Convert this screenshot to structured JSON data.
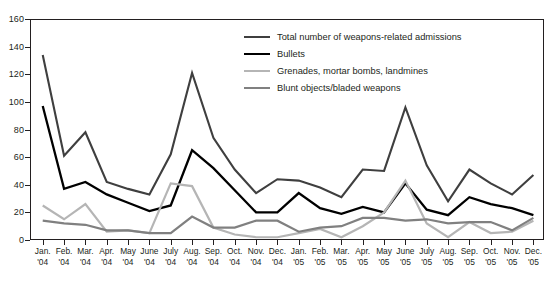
{
  "chart_data": {
    "type": "line",
    "title": "",
    "xlabel": "",
    "ylabel": "",
    "ylim": [
      0,
      160
    ],
    "yticks": [
      0,
      20,
      40,
      60,
      80,
      100,
      120,
      140,
      160
    ],
    "grid": false,
    "legend_position": "top-center",
    "categories": [
      "Jan. '04",
      "Feb. '04",
      "Mar. '04",
      "Apr. '04",
      "May '04",
      "June '04",
      "July '04",
      "Aug. '04",
      "Sep. '04",
      "Oct. '04",
      "Nov. '04",
      "Dec. '04",
      "Jan. '05",
      "Feb. '05",
      "Mar. '05",
      "Apr. '05",
      "May '05",
      "June '05",
      "July '05",
      "Aug. '05",
      "Sep. '05",
      "Oct. '05",
      "Nov. '05",
      "Dec. '05"
    ],
    "category_lines": [
      [
        "Jan.",
        "'04"
      ],
      [
        "Feb.",
        "'04"
      ],
      [
        "Mar.",
        "'04"
      ],
      [
        "Apr.",
        "'04"
      ],
      [
        "May",
        "'04"
      ],
      [
        "June",
        "'04"
      ],
      [
        "July",
        "'04"
      ],
      [
        "Aug.",
        "'04"
      ],
      [
        "Sep.",
        "'04"
      ],
      [
        "Oct.",
        "'04"
      ],
      [
        "Nov.",
        "'04"
      ],
      [
        "Dec.",
        "'04"
      ],
      [
        "Jan.",
        "'05"
      ],
      [
        "Feb.",
        "'05"
      ],
      [
        "Mar.",
        "'05"
      ],
      [
        "Apr.",
        "'05"
      ],
      [
        "May",
        "'05"
      ],
      [
        "June",
        "'05"
      ],
      [
        "July",
        "'05"
      ],
      [
        "Aug.",
        "'05"
      ],
      [
        "Sep.",
        "'05"
      ],
      [
        "Oct.",
        "'05"
      ],
      [
        "Nov.",
        "'05"
      ],
      [
        "Dec.",
        "'05"
      ]
    ],
    "series": [
      {
        "name": "Total number of weapons-related admissions",
        "color": "#3f3f3f",
        "width": 2.1,
        "values": [
          134,
          61,
          78,
          42,
          37,
          33,
          62,
          121,
          74,
          51,
          34,
          44,
          43,
          38,
          31,
          51,
          50,
          96,
          54,
          28,
          51,
          41,
          33,
          47
        ]
      },
      {
        "name": "Bullets",
        "color": "#000000",
        "width": 2.3,
        "values": [
          97,
          37,
          42,
          33,
          27,
          21,
          25,
          65,
          52,
          36,
          20,
          20,
          34,
          23,
          19,
          24,
          20,
          41,
          22,
          18,
          31,
          26,
          23,
          18
        ]
      },
      {
        "name": "Grenades, mortar bombs, landmines",
        "color": "#b5b5b5",
        "width": 2.2,
        "values": [
          25,
          15,
          26,
          6,
          7,
          5,
          41,
          39,
          9,
          4,
          2,
          2,
          5,
          8,
          2,
          10,
          20,
          43,
          12,
          2,
          13,
          5,
          6,
          14
        ]
      },
      {
        "name": "Blunt objects/bladed weapons",
        "color": "#808080",
        "width": 2.2,
        "values": [
          14,
          12,
          11,
          7,
          7,
          5,
          5,
          17,
          9,
          9,
          14,
          14,
          6,
          9,
          10,
          16,
          16,
          14,
          15,
          12,
          13,
          13,
          7,
          16
        ]
      }
    ]
  }
}
